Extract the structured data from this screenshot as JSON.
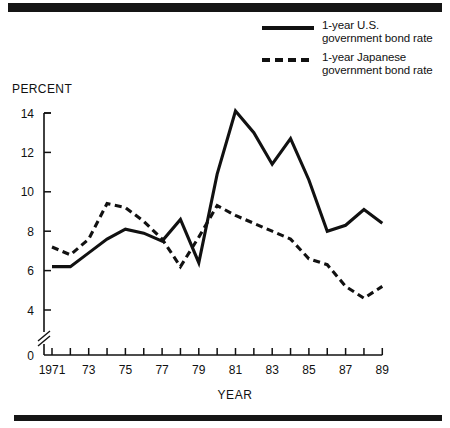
{
  "figure": {
    "percent_label": "PERCENT",
    "year_label": "YEAR"
  },
  "legend": {
    "items": [
      {
        "style": "solid",
        "swatch_name": "legend-swatch-solid",
        "line1": "1-year U.S.",
        "line2": "government bond rate"
      },
      {
        "style": "dashed",
        "swatch_name": "legend-swatch-dashed",
        "line1": "1-year Japanese",
        "line2": "government bond rate"
      }
    ]
  },
  "chart_data": {
    "type": "line",
    "title": "",
    "subtitle": "",
    "xlabel": "YEAR",
    "ylabel": "PERCENT",
    "xlim": [
      1971,
      1989
    ],
    "ylim": [
      0,
      14
    ],
    "y_axis_break": true,
    "y_axis_break_between": [
      0,
      4
    ],
    "grid": false,
    "legend_position": "top-right",
    "y_ticks": [
      0,
      4,
      6,
      8,
      10,
      12,
      14
    ],
    "y_tick_labels": [
      "0",
      "4",
      "6",
      "8",
      "10",
      "12",
      "14"
    ],
    "x_ticks": [
      1971,
      1972,
      1973,
      1974,
      1975,
      1976,
      1977,
      1978,
      1979,
      1980,
      1981,
      1982,
      1983,
      1984,
      1985,
      1986,
      1987,
      1988,
      1989
    ],
    "x_tick_labels": [
      "1971",
      "",
      "73",
      "",
      "75",
      "",
      "77",
      "",
      "79",
      "",
      "81",
      "",
      "83",
      "",
      "85",
      "",
      "87",
      "",
      "89"
    ],
    "x": [
      1971,
      1972,
      1973,
      1974,
      1975,
      1976,
      1977,
      1978,
      1979,
      1980,
      1981,
      1982,
      1983,
      1984,
      1985,
      1986,
      1987,
      1988,
      1989
    ],
    "series": [
      {
        "name": "1-year U.S. government bond rate",
        "style": "solid",
        "values": [
          6.2,
          6.2,
          6.9,
          7.6,
          8.1,
          7.9,
          7.5,
          8.6,
          6.4,
          10.9,
          14.1,
          13.0,
          11.4,
          12.7,
          10.6,
          8.0,
          8.3,
          9.1,
          8.4
        ]
      },
      {
        "name": "1-year Japanese government bond rate",
        "style": "dashed",
        "values": [
          7.2,
          6.8,
          7.6,
          9.4,
          9.2,
          8.5,
          7.6,
          6.2,
          7.7,
          9.3,
          8.8,
          8.4,
          8.0,
          7.6,
          6.6,
          6.3,
          5.2,
          4.6,
          5.2
        ]
      }
    ]
  }
}
